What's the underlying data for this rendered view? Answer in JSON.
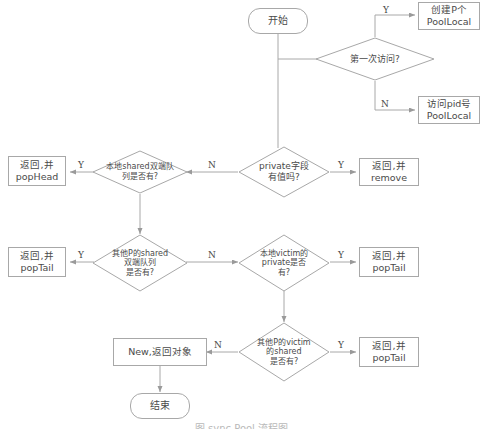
{
  "figure": {
    "type": "flowchart",
    "title_caption": "图 sync.Pool 流程图",
    "language": "zh-CN",
    "colors": {
      "background": "#ffffff",
      "stroke": "#a8a8a8",
      "text": "#4a4a4a",
      "caption": "#b9b9b9"
    }
  },
  "nodes": {
    "start": {
      "label": "开始",
      "shape": "terminator"
    },
    "first_visit": {
      "label_line1": "第一次访问?",
      "shape": "decision"
    },
    "create_poollocal": {
      "label_line1": "创建P个",
      "label_line2": "PoolLocal",
      "shape": "process"
    },
    "access_pid_poollocal": {
      "label_line1": "访问pid号",
      "label_line2": "PoolLocal",
      "shape": "process"
    },
    "private_has_value": {
      "label_line1": "private字段",
      "label_line2": "有值吗?",
      "shape": "decision"
    },
    "return_remove": {
      "label_line1": "返回,并",
      "label_line2": "remove",
      "shape": "process"
    },
    "local_shared_deque": {
      "label_line1": "本地shared双端队",
      "label_line2": "列是否有?",
      "shape": "decision"
    },
    "return_pophead": {
      "label_line1": "返回,并",
      "label_line2": "popHead",
      "shape": "process"
    },
    "other_p_shared_deque": {
      "label_line1": "其他P的shared",
      "label_line2": "双端队列",
      "label_line3": "是否有?",
      "shape": "decision"
    },
    "return_poptail_left": {
      "label_line1": "返回,并",
      "label_line2": "popTail",
      "shape": "process"
    },
    "local_victim_private": {
      "label_line1": "本地victim的",
      "label_line2": "private是否",
      "label_line3": "有?",
      "shape": "decision"
    },
    "return_poptail_mid": {
      "label_line1": "返回,并",
      "label_line2": "popTail",
      "shape": "process"
    },
    "other_p_victim_shared": {
      "label_line1": "其他P的victim",
      "label_line2": "的shared",
      "label_line3": "是否有?",
      "shape": "decision"
    },
    "return_poptail_bottom": {
      "label_line1": "返回,并",
      "label_line2": "popTail",
      "shape": "process"
    },
    "new_return_object": {
      "label_line1": "New,返回对象",
      "shape": "process"
    },
    "end": {
      "label": "结束",
      "shape": "terminator"
    }
  },
  "edge_labels": {
    "first_visit_yes": "Y",
    "first_visit_no": "N",
    "private_yes": "Y",
    "private_no": "N",
    "local_shared_yes": "Y",
    "local_shared_no": "N",
    "other_shared_yes": "Y",
    "other_shared_no": "N",
    "victim_private_yes": "Y",
    "victim_shared_yes": "Y",
    "victim_shared_no": "N"
  }
}
